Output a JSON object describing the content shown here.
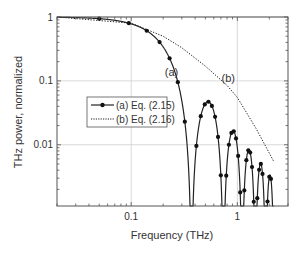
{
  "chart_data": {
    "type": "line",
    "title": "",
    "xlabel": "Frequency (THz)",
    "ylabel": "THz power, normalized",
    "xscale": "log",
    "yscale": "log",
    "xlim": [
      0.02,
      3.0
    ],
    "ylim": [
      0.0011,
      1.0
    ],
    "x_ticks": [
      {
        "value": 0.1,
        "label": "0.1"
      },
      {
        "value": 1,
        "label": "1"
      }
    ],
    "y_ticks": [
      {
        "value": 1,
        "label": "1"
      },
      {
        "value": 0.1,
        "label": "0.1"
      },
      {
        "value": 0.01,
        "label": "0.01"
      }
    ],
    "grid": true,
    "legend": {
      "position": "left-middle",
      "entries": [
        {
          "label": "(a) Eq. (2.15)",
          "style": "solid-with-markers"
        },
        {
          "label": "(b) Eq. (2.16)",
          "style": "dotted"
        }
      ]
    },
    "annotations": [
      {
        "text": "(a)",
        "x": 0.24,
        "y": 0.12
      },
      {
        "text": "(b)",
        "x": 0.82,
        "y": 0.095
      }
    ],
    "series": [
      {
        "name": "(a) Eq. (2.15)",
        "model": "sinc^2(pi f / 0.37)",
        "first_null_THz": 0.37,
        "sidelobe_peaks": [
          {
            "x": 0.55,
            "y": 0.047
          },
          {
            "x": 0.93,
            "y": 0.016
          },
          {
            "x": 1.3,
            "y": 0.0075
          },
          {
            "x": 1.65,
            "y": 0.0045
          },
          {
            "x": 2.0,
            "y": 0.003
          }
        ],
        "sample_points": [
          {
            "x": 0.02,
            "y": 1.0
          },
          {
            "x": 0.05,
            "y": 0.94
          },
          {
            "x": 0.1,
            "y": 0.78
          },
          {
            "x": 0.15,
            "y": 0.55
          },
          {
            "x": 0.2,
            "y": 0.34
          },
          {
            "x": 0.25,
            "y": 0.17
          },
          {
            "x": 0.3,
            "y": 0.055
          },
          {
            "x": 0.37,
            "y": 0.0
          },
          {
            "x": 0.55,
            "y": 0.047
          },
          {
            "x": 0.74,
            "y": 0.0
          },
          {
            "x": 0.93,
            "y": 0.016
          },
          {
            "x": 1.11,
            "y": 0.0
          },
          {
            "x": 1.3,
            "y": 0.0075
          },
          {
            "x": 1.48,
            "y": 0.0
          },
          {
            "x": 1.65,
            "y": 0.0045
          },
          {
            "x": 1.85,
            "y": 0.0
          },
          {
            "x": 2.0,
            "y": 0.003
          },
          {
            "x": 2.22,
            "y": 0.0
          }
        ]
      },
      {
        "name": "(b) Eq. (2.16)",
        "sample_points": [
          {
            "x": 0.02,
            "y": 1.0
          },
          {
            "x": 0.1,
            "y": 0.8
          },
          {
            "x": 0.2,
            "y": 0.5
          },
          {
            "x": 0.3,
            "y": 0.33
          },
          {
            "x": 0.5,
            "y": 0.17
          },
          {
            "x": 0.8,
            "y": 0.085
          },
          {
            "x": 1.0,
            "y": 0.055
          },
          {
            "x": 1.5,
            "y": 0.018
          },
          {
            "x": 2.2,
            "y": 0.0055
          }
        ]
      }
    ]
  }
}
